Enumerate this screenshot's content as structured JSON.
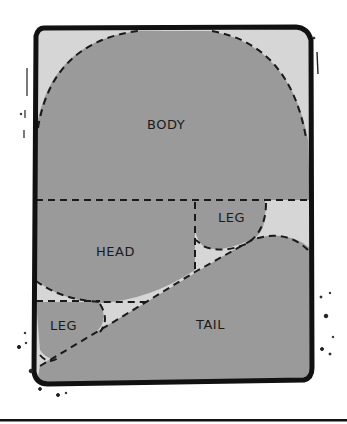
{
  "diagram": {
    "type": "cartoon-layout-diagram",
    "regions": [
      {
        "id": "body",
        "label": "BODY",
        "x": 158,
        "y": 128
      },
      {
        "id": "head",
        "label": "HEAD",
        "x": 113,
        "y": 256
      },
      {
        "id": "leg_upper",
        "label": "LEG",
        "x": 235,
        "y": 220
      },
      {
        "id": "leg_lower",
        "label": "LEG",
        "x": 65,
        "y": 330
      },
      {
        "id": "tail",
        "label": "TAIL",
        "x": 215,
        "y": 328
      }
    ]
  },
  "labels": {
    "body": "BODY",
    "head": "HEAD",
    "leg_upper": "LEG",
    "leg_lower": "LEG",
    "tail": "TAIL"
  },
  "colors": {
    "background": "#ffffff",
    "frame_stroke": "#111111",
    "shape_fill": "#9a9a9a",
    "gap_fill": "#d6d6d6",
    "dash_stroke": "#1a1a1a"
  }
}
